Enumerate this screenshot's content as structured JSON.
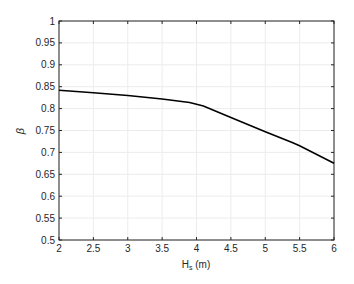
{
  "chart_data": {
    "type": "line",
    "title": "",
    "xlabel": "H_s (m)",
    "xlabel_main": "H",
    "xlabel_sub": "s",
    "xlabel_unit": " (m)",
    "ylabel": "β",
    "xlim": [
      2,
      6
    ],
    "ylim": [
      0.5,
      1
    ],
    "xticks": [
      "2",
      "2.5",
      "3",
      "3.5",
      "4",
      "4.5",
      "5",
      "5.5",
      "6"
    ],
    "yticks": [
      "0.5",
      "0.55",
      "0.6",
      "0.65",
      "0.7",
      "0.75",
      "0.8",
      "0.85",
      "0.9",
      "0.95",
      "1"
    ],
    "grid": true,
    "legend": null,
    "series": [
      {
        "name": "beta",
        "color": "#000000",
        "x": [
          2,
          2.5,
          3,
          3.5,
          3.9,
          4.1,
          4.5,
          5,
          5.4,
          5.5,
          6
        ],
        "values": [
          0.842,
          0.836,
          0.83,
          0.822,
          0.814,
          0.806,
          0.78,
          0.747,
          0.722,
          0.715,
          0.675
        ]
      }
    ]
  }
}
